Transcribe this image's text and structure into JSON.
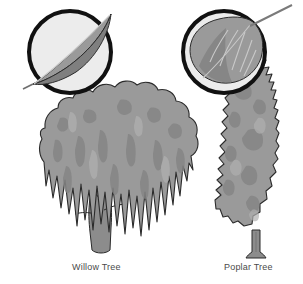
{
  "figure": {
    "background_color": "#ffffff",
    "width": 303,
    "height": 284
  },
  "palette": {
    "foliage": "#9a9a9a",
    "foliage_shadow": "#848484",
    "foliage_highlight": "#adadad",
    "trunk": "#8c8c8c",
    "trunk_shadow": "#787878",
    "outline": "#2b2b2b",
    "lens_fill": "#ececec",
    "lens_ring": "#111111",
    "leaf_fill": "#9a9a9a",
    "leaf_shadow": "#7f7f7f",
    "leaf_vein": "#c9c9c9",
    "caption_text": "#4a4a4a"
  },
  "trees": [
    {
      "id": "willow",
      "caption": "Willow Tree",
      "crown_shape": "broad weeping canopy with drooping fronds",
      "trunk": "short branching trunk",
      "leaf": {
        "name": "willow-leaf",
        "shape": "narrow lanceolate",
        "orientation": "diagonal, tip to upper right"
      }
    },
    {
      "id": "poplar",
      "caption": "Poplar Tree",
      "crown_shape": "tall narrow columnar crown",
      "trunk": "short straight trunk",
      "leaf": {
        "name": "poplar-leaf",
        "shape": "broad ovate with toothed margin",
        "orientation": "petiole to upper right"
      }
    }
  ],
  "lenses": [
    {
      "id": "willow-lens",
      "cx": 70,
      "cy": 52,
      "r": 41
    },
    {
      "id": "poplar-lens",
      "cx": 224,
      "cy": 52,
      "r": 41
    }
  ]
}
